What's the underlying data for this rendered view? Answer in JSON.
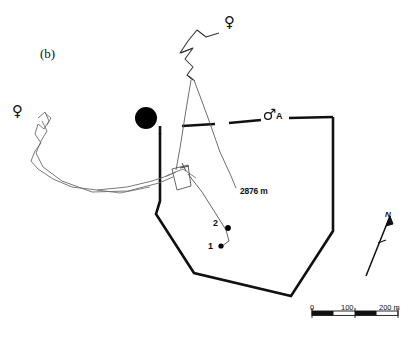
{
  "figure": {
    "panel_label": "(b)",
    "type": "radio-tracking home range map",
    "background_color": "#ffffff",
    "line_color": "#111111",
    "track_color": "#6b6b6b"
  },
  "annotations": {
    "distance_label": "2876 m",
    "point_1_label": "1",
    "point_2_label": "2",
    "male_a_label": "A",
    "male_symbol": "♂",
    "female_symbol": "♀",
    "north_label": "N"
  },
  "markers": {
    "filled_circle": {
      "name": "black-filled-circle",
      "cx": 146,
      "cy": 118,
      "r": 11,
      "color": "#000000"
    },
    "point_1": {
      "cx": 221,
      "cy": 246,
      "r": 2.6
    },
    "point_2": {
      "cx": 228,
      "cy": 228,
      "r": 2.8
    }
  },
  "scale_bar": {
    "labels": [
      "0",
      "100",
      "200 m"
    ],
    "tick_values": [
      0,
      100,
      200
    ],
    "units": "m",
    "x_start": 312,
    "x_end": 398,
    "y": 313
  },
  "legend_symbols": [
    {
      "name": "female-top",
      "symbol": "♀",
      "x": 224,
      "y": 13
    },
    {
      "name": "female-left",
      "symbol": "♀",
      "x": 12,
      "y": 102
    },
    {
      "name": "male-a",
      "symbol": "♂",
      "label": "A",
      "x": 266,
      "y": 113
    }
  ],
  "home_range_polygon": {
    "name": "home-range-boundary",
    "style": "thick black, dashed along northern edge",
    "solid_path": "M 160,133 L 160,200 L 156,213 L 194,273 L 290,296 L 333,232 L 333,117 L 286,117",
    "dashed_segments": [
      "M 160,133 L 160,125",
      "M 181,125 L 214,124",
      "M 228,123 L 262,120",
      "M 288,118 L 333,117"
    ]
  },
  "tracks": [
    {
      "name": "female-top-track",
      "description": "zigzag path descending from upper female symbol splitting into two legs",
      "path": "M 218,32 L 205,36 L 196,30 L 188,40 L 181,52 L 192,48 L 186,58 L 192,66 L 188,74 L 193,79"
    },
    {
      "name": "female-top-leg-left",
      "path": "M 191,79 L 184,120 L 178,160 L 176,172"
    },
    {
      "name": "female-top-leg-right",
      "path": "M 193,79 L 208,120 L 222,155 L 232,174 L 235,186"
    },
    {
      "name": "female-left-track",
      "description": "winding path from left female symbol eastward to nest area",
      "path": "M 38,117 L 44,113 L 48,121 L 44,128 L 39,124 L 36,133 L 41,142 L 36,150 L 31,160 L 37,168 L 52,178 L 70,186 L 95,189 L 125,186 L 150,181 L 166,176 L 175,172"
    },
    {
      "name": "female-left-track-second",
      "path": "M 42,120 L 46,130 L 40,140 L 35,152 L 42,166 L 60,180 L 90,191 L 126,190 L 158,182 L 172,176"
    },
    {
      "name": "nest-quadrilateral",
      "description": "small quadrilateral with cross marker at convergence point",
      "path": "M 172,168 L 187,165 L 190,185 L 176,189 Z"
    },
    {
      "name": "descending-track-to-points",
      "path": "M 186,172 L 200,190 L 214,212 L 224,228 L 228,240 L 221,246"
    }
  ],
  "north_arrow": {
    "name": "north-arrow",
    "from_x": 366,
    "from_y": 275,
    "to_x": 389,
    "to_y": 215
  }
}
